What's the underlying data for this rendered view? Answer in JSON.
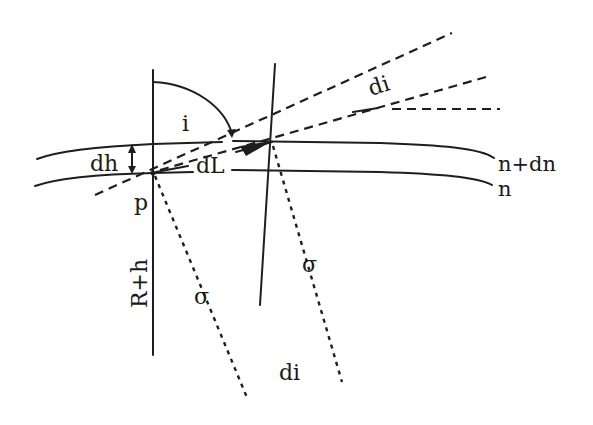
{
  "figure": {
    "stroke_color": "#1e1e1e",
    "background": "#ffffff"
  },
  "labels": {
    "angle_i": "i",
    "dh": "dh",
    "dL": "dL",
    "point_p": "p",
    "radius": "R+h",
    "sigma_left": "σ",
    "sigma_right": "σ",
    "di_top": "di",
    "di_bottom": "di",
    "layer_upper": "n+dn",
    "layer_lower": "n"
  }
}
